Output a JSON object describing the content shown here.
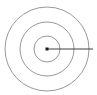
{
  "diagram": {
    "type": "concentric-circles",
    "canvas": {
      "width": 97,
      "height": 95,
      "background_color": "#ffffff"
    },
    "center": {
      "x": 47,
      "y": 49,
      "label": "",
      "marker": {
        "shape": "square",
        "size": 3,
        "color": "#1a1a1a"
      }
    },
    "rings": [
      {
        "name": "outer-ring",
        "radius": 42,
        "stroke_color": "#8c8c8c",
        "stroke_width": 0.9
      },
      {
        "name": "middle-ring",
        "radius": 27,
        "stroke_color": "#8c8c8c",
        "stroke_width": 0.9
      },
      {
        "name": "inner-ring",
        "radius": 13,
        "stroke_color": "#8c8c8c",
        "stroke_width": 0.9
      }
    ],
    "radial_line": {
      "name": "radius-line",
      "from_x": 47,
      "from_y": 49,
      "to_x": 93,
      "to_y": 49,
      "stroke_color": "#2b2b2b",
      "stroke_width": 0.9,
      "label": ""
    }
  }
}
